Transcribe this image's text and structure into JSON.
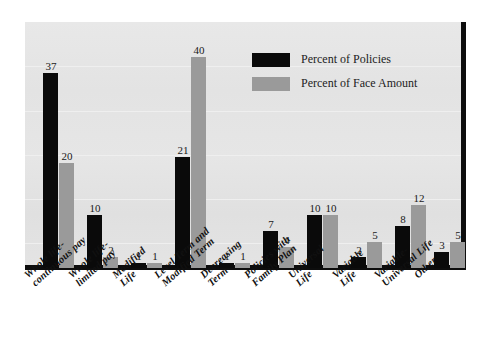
{
  "chart_data": {
    "type": "bar",
    "title": "",
    "subtitle": "",
    "xlabel": "",
    "ylabel": "",
    "ylim": [
      0,
      44
    ],
    "grid": true,
    "legend_position": "top-right",
    "categories": [
      "Whole life-\ncontinuous pay",
      "Whole life-\nlimited pay",
      "Modified\nLife",
      "Level Term and\nModified Term",
      "Decreasing\nTerm",
      "Policies with\nFamily Plan",
      "Universal\nLife",
      "Variable\nLife",
      "Variable-\nUniversal Life",
      "Other"
    ],
    "category_lines": [
      [
        "Whole life-",
        "continuous pay"
      ],
      [
        "Whole life-",
        "limited pay"
      ],
      [
        "Modified",
        "Life"
      ],
      [
        "Level Term and",
        "Modified Term"
      ],
      [
        "Decreasing",
        "Term"
      ],
      [
        "Policies with",
        "Family Plan"
      ],
      [
        "Universal",
        "Life"
      ],
      [
        "Variable",
        "Life"
      ],
      [
        "Variable-",
        "Universal Life"
      ],
      [
        "Other",
        ""
      ]
    ],
    "series": [
      {
        "name": "Percent of Policies",
        "color": "#0a0a0a",
        "values": [
          37,
          10,
          1,
          21,
          1,
          7,
          10,
          2,
          8,
          3
        ]
      },
      {
        "name": "Percent of Face Amount",
        "color": "#9a9a9a",
        "values": [
          20,
          2,
          1,
          40,
          1,
          4,
          10,
          5,
          12,
          5
        ]
      }
    ]
  },
  "legend": {
    "items": [
      {
        "label": "Percent of Policies",
        "color": "#0a0a0a"
      },
      {
        "label": "Percent of Face Amount",
        "color": "#9a9a9a"
      }
    ]
  },
  "colors": {
    "series_policies": "#0a0a0a",
    "series_face_amount": "#9a9a9a",
    "plot_background": "#e4e4e4",
    "axis": "#0d0d0d",
    "page_background": "#ffffff"
  }
}
